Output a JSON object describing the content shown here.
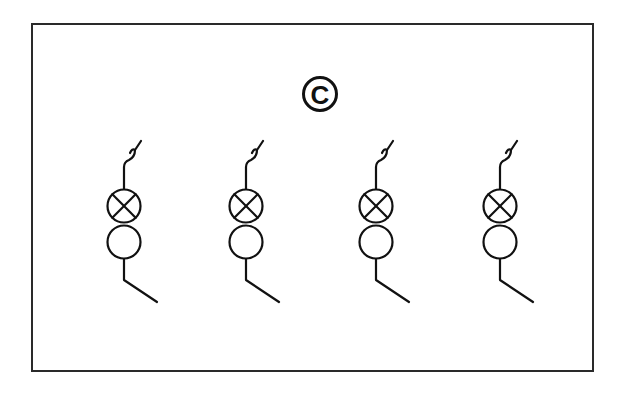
{
  "diagram": {
    "label": "C",
    "stroke_color": "#111111",
    "frame_color": "#2a2a2a",
    "symbols": [
      {
        "id": 1,
        "type": "switched-lamp-circuit",
        "cx": 124
      },
      {
        "id": 2,
        "type": "switched-lamp-circuit",
        "cx": 246
      },
      {
        "id": 3,
        "type": "switched-lamp-circuit",
        "cx": 376
      },
      {
        "id": 4,
        "type": "switched-lamp-circuit",
        "cx": 500
      }
    ],
    "components": [
      "switch-contact",
      "lamp-indicator",
      "circle-element",
      "lead-line"
    ]
  }
}
